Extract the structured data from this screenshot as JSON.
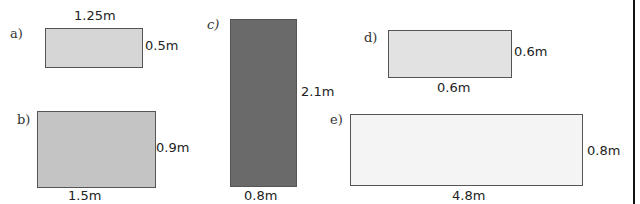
{
  "shapes": [
    {
      "id": "a",
      "label": "a)",
      "width_label": "1.25m",
      "height_label": "0.5m",
      "fill": "#d6d6d6"
    },
    {
      "id": "b",
      "label": "b)",
      "width_label": "1.5m",
      "height_label": "0.9m",
      "fill": "#c4c4c4"
    },
    {
      "id": "c",
      "label": "c)",
      "width_label": "0.8m",
      "height_label": "2.1m",
      "fill": "#6a6a6a"
    },
    {
      "id": "d",
      "label": "d)",
      "width_label": "0.6m",
      "height_label": "0.6m",
      "fill": "#e2e2e2"
    },
    {
      "id": "e",
      "label": "e)",
      "width_label": "4.8m",
      "height_label": "0.8m",
      "fill": "#f4f4f4"
    }
  ]
}
